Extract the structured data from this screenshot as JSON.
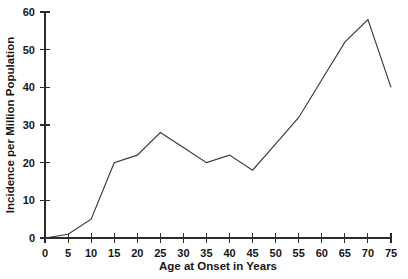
{
  "chart_data": {
    "type": "line",
    "title": "",
    "xlabel": "Age at Onset in Years",
    "ylabel": "Incidence per Million Population",
    "x": [
      0,
      5,
      10,
      15,
      20,
      25,
      30,
      35,
      40,
      45,
      50,
      55,
      60,
      65,
      70,
      75
    ],
    "values": [
      0,
      1,
      5,
      20,
      22,
      28,
      24,
      20,
      22,
      18,
      25,
      32,
      42,
      52,
      58,
      40
    ],
    "series": [
      {
        "name": "Incidence",
        "values": [
          0,
          1,
          5,
          20,
          22,
          28,
          24,
          20,
          22,
          18,
          25,
          32,
          42,
          52,
          58,
          40
        ]
      }
    ],
    "xlim": [
      0,
      75
    ],
    "ylim": [
      0,
      60
    ],
    "xticks": [
      0,
      5,
      10,
      15,
      20,
      25,
      30,
      35,
      40,
      45,
      50,
      55,
      60,
      65,
      70,
      75
    ],
    "yticks": [
      0,
      10,
      20,
      30,
      40,
      50,
      60
    ],
    "xtick_labels": [
      "0",
      "5",
      "10",
      "15",
      "20",
      "25",
      "30",
      "35",
      "40",
      "45",
      "50",
      "55",
      "60",
      "65",
      "70",
      "75"
    ],
    "ytick_labels": [
      "0",
      "10",
      "20",
      "30",
      "40",
      "50",
      "60"
    ],
    "grid": false,
    "legend": false,
    "legend_position": "none",
    "line_color": "#3a3a3a",
    "axis_color": "#2b2b2b",
    "background_color": "#ffffff"
  }
}
